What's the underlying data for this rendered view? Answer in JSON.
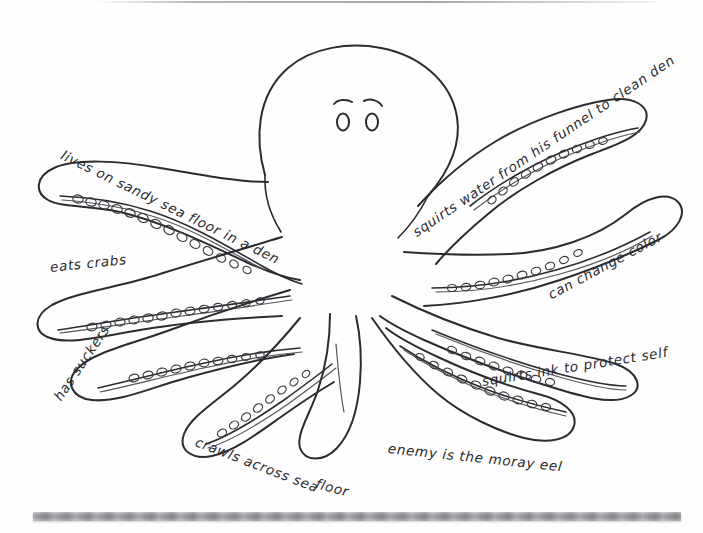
{
  "page": {
    "background_color": "#fefefe",
    "ink_color": "#2a2a2e",
    "paper_artifact_color": "#9a9a9e",
    "media": "hand-drawn pencil sketch on white paper"
  },
  "subject": {
    "name": "octopus",
    "parts": {
      "mantle": "rounded head / mantle",
      "eyes": "two small oval eyes with curved brow strokes",
      "arms": "eight tapering arms with rows of circular suckers"
    }
  },
  "labels": [
    {
      "id": "lives-in-den",
      "text": "lives on sandy sea floor in a den"
    },
    {
      "id": "eats-crabs",
      "text": "eats crabs"
    },
    {
      "id": "has-suckers",
      "text": "has suckers"
    },
    {
      "id": "crawls-1",
      "text": "crawls across sea"
    },
    {
      "id": "crawls-2",
      "text": "floor"
    },
    {
      "id": "moray-eel",
      "text": "enemy is the moray eel"
    },
    {
      "id": "squirts-ink",
      "text": "squirts ink to protect self"
    },
    {
      "id": "change-color",
      "text": "can change  color"
    },
    {
      "id": "squirts-water",
      "text": "squirts water from his funnel to clean den"
    }
  ],
  "artifacts": {
    "top_edge_line": "faint grey scan line across top edge",
    "bottom_bar": "grey horizontal scan bar near bottom"
  }
}
